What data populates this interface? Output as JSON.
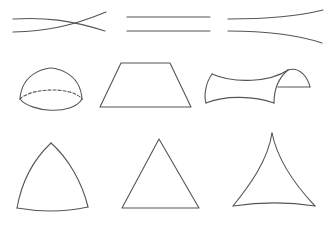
{
  "figure": {
    "stroke_color": "#555555",
    "background": "#ffffff",
    "columns": [
      {
        "name": "spherical",
        "parallel_lines": "converging / crossing lines",
        "surface": "hemisphere",
        "triangle": "triangle with outward-bulging sides"
      },
      {
        "name": "euclidean",
        "parallel_lines": "straight parallel lines",
        "surface": "flat plane (trapezoid in perspective)",
        "triangle": "straight-sided triangle"
      },
      {
        "name": "hyperbolic",
        "parallel_lines": "diverging lines",
        "surface": "saddle surface",
        "triangle": "triangle with inward-curving sides"
      }
    ]
  }
}
